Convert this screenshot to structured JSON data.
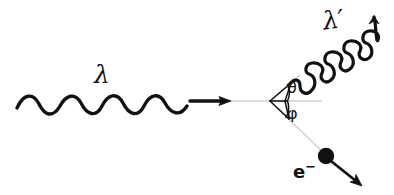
{
  "figure": {
    "background_color": "#ffffff",
    "stroke_color": "#111111",
    "guide_color": "#c9c9c9",
    "width": 394,
    "height": 195
  },
  "labels": {
    "incident_photon": "λ",
    "scattered_photon": "λ′",
    "scatter_angle": "θ",
    "recoil_angle": "φ",
    "electron": "e",
    "electron_charge": "−"
  },
  "elements": {
    "incident_wave": {
      "name": "incident-photon-wave",
      "description": "sinusoidal wave travelling left to right",
      "start_x": 17,
      "end_x": 188,
      "axis_y": 101,
      "amplitude": 12,
      "cycles": 4
    },
    "incident_arrow": {
      "name": "incident-direction-arrow",
      "from_x": 192,
      "to_x": 229,
      "y": 101
    },
    "axis_guide": {
      "name": "incident-axis-guide-line",
      "from_x": 228,
      "to_x": 322,
      "y": 101
    },
    "vertex": {
      "name": "scattering-vertex",
      "x": 270,
      "y": 101
    },
    "scattered_wave": {
      "name": "scattered-photon-wave",
      "start_x": 292,
      "start_y": 83,
      "end_x": 372,
      "end_y": 16,
      "amplitude": 9,
      "cycles": 5
    },
    "electron_track": {
      "name": "recoil-electron-track",
      "from_x": 273,
      "from_y": 105,
      "to_x": 322,
      "to_y": 152
    },
    "electron_dot": {
      "name": "recoil-electron-dot",
      "cx": 326,
      "cy": 156,
      "r": 8
    },
    "electron_arrow": {
      "name": "recoil-electron-arrow",
      "from_x": 332,
      "from_y": 162,
      "to_x": 361,
      "to_y": 186
    },
    "angle_marker_theta": {
      "name": "theta-angle-marker",
      "note": "ray from vertex up-right plus arc"
    },
    "angle_marker_phi": {
      "name": "phi-angle-marker",
      "note": "ray from vertex down-right plus arc"
    }
  }
}
